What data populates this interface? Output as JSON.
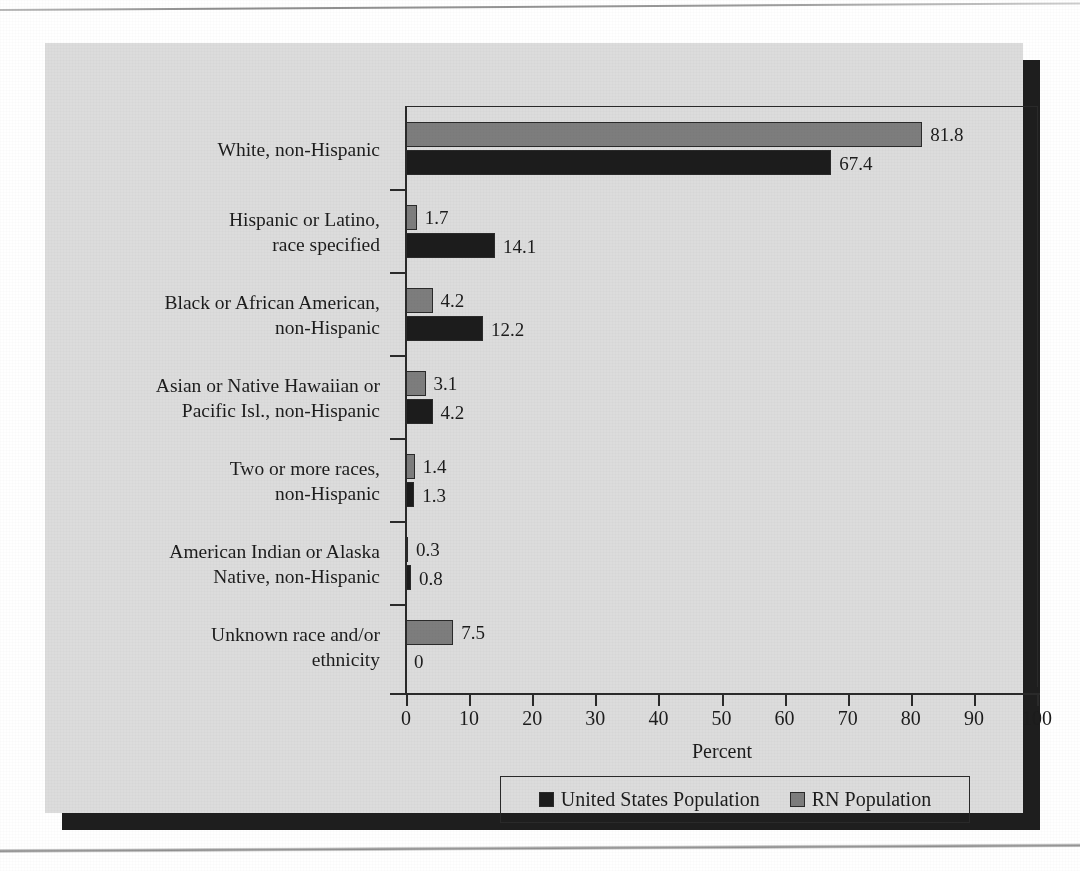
{
  "chart_data": {
    "type": "bar",
    "orientation": "horizontal",
    "title": "",
    "xlabel": "Percent",
    "ylabel": "",
    "xlim": [
      0,
      100
    ],
    "xticks": [
      0,
      10,
      20,
      30,
      40,
      50,
      60,
      70,
      80,
      90,
      100
    ],
    "grid": false,
    "legend_position": "bottom",
    "categories": [
      "White, non-Hispanic",
      "Hispanic or Latino, race specified",
      "Black or African American, non-Hispanic",
      "Asian or Native Hawaiian or Pacific Isl., non-Hispanic",
      "Two or more races, non-Hispanic",
      "American Indian or Alaska Native, non-Hispanic",
      "Unknown race and/or ethnicity"
    ],
    "category_lines": [
      [
        "White, non-Hispanic"
      ],
      [
        "Hispanic or Latino,",
        "race specified"
      ],
      [
        "Black or African American,",
        "non-Hispanic"
      ],
      [
        "Asian or Native Hawaiian or",
        "Pacific Isl., non-Hispanic"
      ],
      [
        "Two or more races,",
        "non-Hispanic"
      ],
      [
        "American Indian or Alaska",
        "Native, non-Hispanic"
      ],
      [
        "Unknown race and/or",
        "ethnicity"
      ]
    ],
    "series": [
      {
        "name": "RN Population",
        "color": "#7d7d7d",
        "values": [
          81.8,
          1.7,
          4.2,
          3.1,
          1.4,
          0.3,
          7.5
        ],
        "labels": [
          "81.8",
          "1.7",
          "4.2",
          "3.1",
          "1.4",
          "0.3",
          "7.5"
        ]
      },
      {
        "name": "United States Population",
        "color": "#1c1c1c",
        "values": [
          67.4,
          14.1,
          12.2,
          4.2,
          1.3,
          0.8,
          0
        ],
        "labels": [
          "67.4",
          "14.1",
          "12.2",
          "4.2",
          "1.3",
          "0.8",
          "0"
        ]
      }
    ]
  },
  "legend": {
    "items": [
      {
        "label": "United States Population",
        "swatch": "us"
      },
      {
        "label": "RN Population",
        "swatch": "rn"
      }
    ]
  },
  "axis": {
    "x_title": "Percent",
    "tick_labels": [
      "0",
      "10",
      "20",
      "30",
      "40",
      "50",
      "60",
      "70",
      "80",
      "90",
      "100"
    ]
  },
  "colors": {
    "rn_bar": "#7d7d7d",
    "us_bar": "#1c1c1c",
    "panel_background": "#dcdcdc",
    "page_background": "#ffffff",
    "axis": "#2a2a2a",
    "shadow": "#1e1e1e"
  },
  "page_bleed_text": [
    "Surveying the ",
    "Nursing ",
    "Workforce"
  ]
}
